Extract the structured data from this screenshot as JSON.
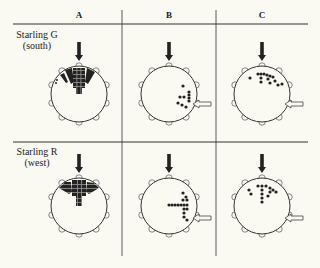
{
  "figure": {
    "columns": [
      {
        "label": "A",
        "x": 79
      },
      {
        "label": "B",
        "x": 169
      },
      {
        "label": "C",
        "x": 262
      }
    ],
    "rows": [
      {
        "label_line1": "Starling G",
        "label_line2": "(south)",
        "y": 94
      },
      {
        "label_line1": "Starling R",
        "label_line2": "(west)",
        "y": 206
      }
    ],
    "colors": {
      "ink": "#222222",
      "background": "#fbfaf2",
      "hollow_arrow_fill": "#fbfaf2"
    }
  }
}
